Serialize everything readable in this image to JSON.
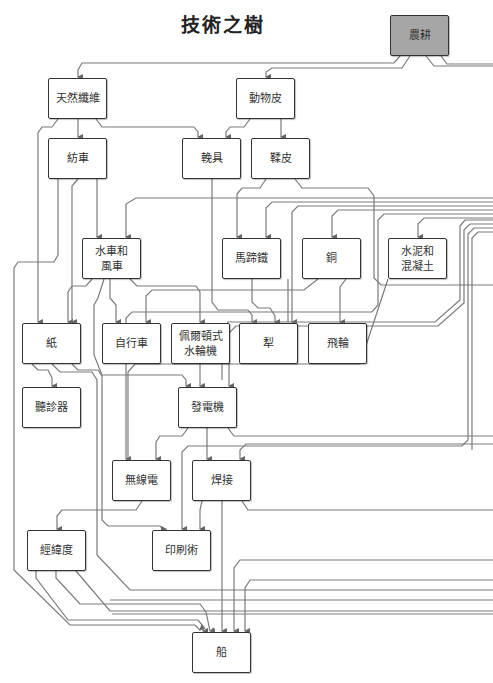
{
  "title": "技術之樹",
  "colors": {
    "line": "#777777",
    "node_border": "#333333",
    "root_fill": "#a6a6a6"
  },
  "nodes": {
    "agriculture": "農耕",
    "natural_fiber": "天然纖維",
    "animal_hide": "動物皮",
    "spinning_wheel": "紡車",
    "harness": "輓具",
    "tanning": "鞣皮",
    "watermill_windmill": "水車和風車",
    "horseshoe": "馬蹄鐵",
    "copper": "銅",
    "cement_concrete": "水泥和混凝土",
    "paper": "紙",
    "bicycle": "自行車",
    "pelton_turbine": "佩爾頓式水輪機",
    "plough": "犁",
    "flywheel": "飛輪",
    "stethoscope": "聽診器",
    "generator": "發電機",
    "radio": "無線電",
    "welding": "焊接",
    "latitude_longitude": "經緯度",
    "printing": "印刷術",
    "ship": "船"
  },
  "node_lines": {
    "watermill_windmill": [
      "水車和",
      "風車"
    ],
    "cement_concrete": [
      "水泥和",
      "混凝土"
    ],
    "pelton_turbine": [
      "佩爾頓式",
      "水輪機"
    ]
  }
}
